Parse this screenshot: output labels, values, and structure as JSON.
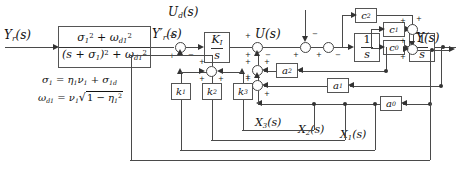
{
  "diagram": {
    "signals": {
      "reference": "Yr(s)",
      "reference_base": "Y",
      "reference_sub": "r",
      "filtered_ref": "Y'r(s)",
      "control": "U(s)",
      "disturbance": "Ud(s)",
      "disturbance_sub": "d",
      "output": "Y(s)",
      "state3": "X3(s)",
      "state2": "X2(s)",
      "state1": "X1(s)"
    },
    "prefilter": {
      "numerator": "σ1² + ωd1²",
      "denominator": "(s + σ1)² + ωd1²"
    },
    "equations": [
      "σ1 = η1ν1 + σ1d",
      "ωd1 = ν1√(1 − η1²)"
    ],
    "blocks": {
      "integral_gain_num": "KI",
      "integral_gain_den": "s",
      "integrator": "1/s",
      "integrator_num": "1",
      "integrator_den": "s",
      "feedback_gains": [
        "k1",
        "k2",
        "k3"
      ],
      "plant_gains": [
        "a2",
        "a1",
        "a0"
      ],
      "output_gains": [
        "c2",
        "c1",
        "c0"
      ]
    },
    "signs": {
      "plus": "+",
      "minus": "−"
    }
  }
}
